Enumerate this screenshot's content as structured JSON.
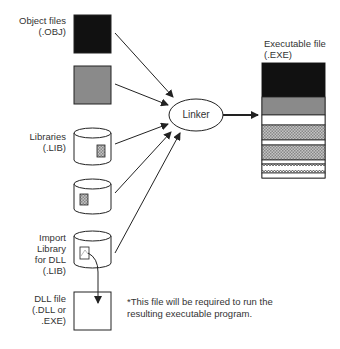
{
  "diagram": {
    "inputs": {
      "object_files": {
        "label_line1": "Object files",
        "label_line2": "(.OBJ)"
      },
      "libraries": {
        "label_line1": "Libraries",
        "label_line2": "(.LIB)"
      },
      "import_library": {
        "label_line1": "Import",
        "label_line2": "Library",
        "label_line3": "for DLL",
        "label_line4": "(.LIB)"
      },
      "dll_file": {
        "label_line1": "DLL file",
        "label_line2": "(.DLL or",
        "label_line3": ".EXE)"
      }
    },
    "linker": {
      "label": "Linker"
    },
    "output": {
      "label_line1": "Executable file",
      "label_line2": "(.EXE)"
    },
    "note": {
      "line1": "*This file will be required to run the",
      "line2": "resulting executable program."
    },
    "colors": {
      "black_block": "#111111",
      "gray_block": "#8a8a8a",
      "hatch": "#a8a8a8",
      "stroke": "#222222"
    }
  }
}
